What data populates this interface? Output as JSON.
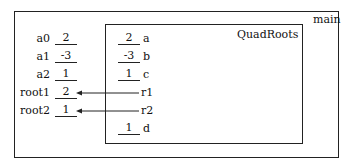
{
  "main": {
    "title": "main",
    "variables": [
      {
        "name": "a0",
        "value": "2"
      },
      {
        "name": "a1",
        "value": "-3"
      },
      {
        "name": "a2",
        "value": "1"
      },
      {
        "name": "root1",
        "value": "2"
      },
      {
        "name": "root2",
        "value": "1"
      }
    ]
  },
  "quadroots": {
    "title": "QuadRoots",
    "params": [
      {
        "name": "a",
        "value": "2"
      },
      {
        "name": "b",
        "value": "-3"
      },
      {
        "name": "c",
        "value": "1"
      },
      {
        "name": "r1",
        "ref": "root1"
      },
      {
        "name": "r2",
        "ref": "root2"
      },
      {
        "name": "d",
        "value": "1"
      }
    ]
  }
}
